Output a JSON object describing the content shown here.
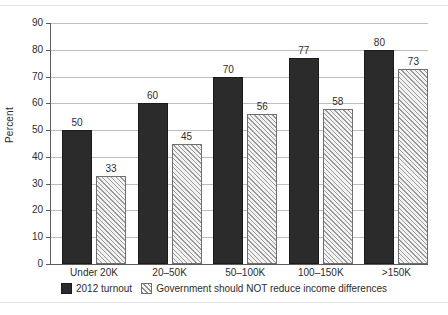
{
  "chart_data": {
    "type": "bar",
    "title": "",
    "subtitle": "",
    "xlabel": "",
    "ylabel": "Percent",
    "ylim": [
      0,
      90
    ],
    "yticks": [
      0,
      10,
      20,
      30,
      40,
      50,
      60,
      70,
      80,
      90
    ],
    "grid": true,
    "legend_position": "bottom",
    "categories": [
      "Under 20K",
      "20–50K",
      "50–100K",
      "100–150K",
      ">150K"
    ],
    "series": [
      {
        "name": "2012 turnout",
        "style": "solid-dark",
        "color": "#2b2b2b",
        "values": [
          50,
          60,
          70,
          77,
          80
        ]
      },
      {
        "name": "Government should NOT reduce income differences",
        "style": "diagonal-hatch",
        "color": "#f2f2f2",
        "values": [
          33,
          45,
          56,
          58,
          73
        ]
      }
    ],
    "value_labels": [
      [
        "50",
        "33"
      ],
      [
        "60",
        "45"
      ],
      [
        "70",
        "56"
      ],
      [
        "77",
        "58"
      ],
      [
        "80",
        "73"
      ]
    ]
  },
  "axis": {
    "y_title": "Percent",
    "y_tick_labels": [
      "0",
      "10",
      "20",
      "30",
      "40",
      "50",
      "60",
      "70",
      "80",
      "90"
    ]
  },
  "legend": {
    "items": [
      {
        "label": "2012 turnout",
        "swatch": "solid-dark-swatch"
      },
      {
        "label": "Government should NOT reduce income differences",
        "swatch": "diagonal-hatch-swatch"
      }
    ]
  }
}
